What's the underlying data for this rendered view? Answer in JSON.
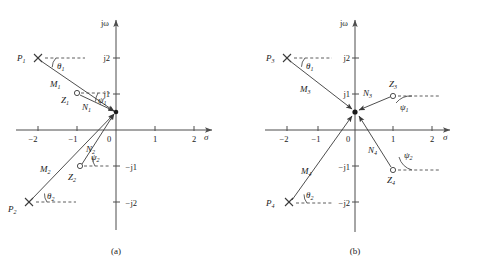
{
  "figure": {
    "panels": [
      {
        "caption": "(a)",
        "axes": {
          "x_label": "σ",
          "y_label": "jω",
          "x_ticks": [
            "−2",
            "−1",
            "0",
            "1",
            "2"
          ],
          "y_ticks_pos": [
            "j2",
            "j1"
          ],
          "y_ticks_neg": [
            "−j1",
            "−j2"
          ]
        },
        "poles": [
          {
            "label": "P",
            "sub": "1",
            "marker": "x-marker",
            "sigma": -2,
            "omega": 2
          },
          {
            "label": "P",
            "sub": "2",
            "marker": "x-marker",
            "sigma": -2,
            "omega": -2
          }
        ],
        "zeros": [
          {
            "label": "Z",
            "sub": "1",
            "marker": "o-marker",
            "sigma": -1,
            "omega": 1
          },
          {
            "label": "Z",
            "sub": "2",
            "marker": "o-marker",
            "sigma": -1,
            "omega": -1
          }
        ],
        "vectors": [
          {
            "label": "M",
            "sub": "1"
          },
          {
            "label": "M",
            "sub": "2"
          },
          {
            "label": "N",
            "sub": "1"
          },
          {
            "label": "N",
            "sub": "2"
          }
        ],
        "angles": [
          {
            "label": "θ",
            "sub": "1"
          },
          {
            "label": "θ",
            "sub": "2"
          },
          {
            "label": "ψ",
            "sub": "1"
          },
          {
            "label": "ψ",
            "sub": "2"
          }
        ]
      },
      {
        "caption": "(b)",
        "axes": {
          "x_label": "σ",
          "y_label": "jω",
          "x_ticks": [
            "−2",
            "−1",
            "0",
            "1",
            "2"
          ],
          "y_ticks_pos": [
            "j2",
            "j1"
          ],
          "y_ticks_neg": [
            "−j1",
            "−j2"
          ]
        },
        "poles": [
          {
            "label": "P",
            "sub": "3",
            "marker": "x-marker",
            "sigma": -2,
            "omega": 2
          },
          {
            "label": "P",
            "sub": "4",
            "marker": "x-marker",
            "sigma": -2,
            "omega": -2
          }
        ],
        "zeros": [
          {
            "label": "Z",
            "sub": "3",
            "marker": "o-marker",
            "sigma": 1,
            "omega": 1
          },
          {
            "label": "Z",
            "sub": "4",
            "marker": "o-marker",
            "sigma": 1,
            "omega": -1
          }
        ],
        "vectors": [
          {
            "label": "M",
            "sub": "3"
          },
          {
            "label": "M",
            "sub": "4"
          },
          {
            "label": "N",
            "sub": "3"
          },
          {
            "label": "N",
            "sub": "4"
          }
        ],
        "angles": [
          {
            "label": "θ",
            "sub": "1"
          },
          {
            "label": "θ",
            "sub": "2"
          },
          {
            "label": "ψ",
            "sub": "1"
          },
          {
            "label": "ψ",
            "sub": "2"
          }
        ]
      }
    ],
    "colors": {
      "ink": "#1a1a1a",
      "axis": "#4d4d4d",
      "line": "#3a3a3a",
      "background": "#ffffff"
    }
  }
}
